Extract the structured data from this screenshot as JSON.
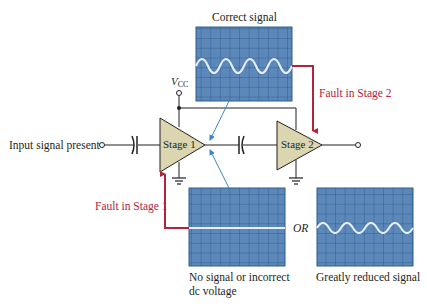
{
  "labels": {
    "correct_signal": "Correct signal",
    "vcc_main": "V",
    "vcc_sub": "CC",
    "input": "Input signal present",
    "stage1": "Stage 1",
    "stage2": "Stage 2",
    "fault_stage2": "Fault in Stage 2",
    "fault_stage1": "Fault in Stage 1",
    "or": "OR",
    "no_signal_line1": "No signal or incorrect",
    "no_signal_line2": "dc voltage",
    "reduced_signal": "Greatly reduced signal"
  },
  "scopes": [
    {
      "id": "correct",
      "caption": "Correct signal",
      "waveform": "sine",
      "cycles": 4,
      "amplitude": "full"
    },
    {
      "id": "no-signal",
      "caption": "No signal or incorrect dc voltage",
      "waveform": "flat"
    },
    {
      "id": "reduced",
      "caption": "Greatly reduced signal",
      "waveform": "sine",
      "cycles": 4,
      "amplitude": "reduced"
    }
  ],
  "colors": {
    "scope_bg": "#5b88b9",
    "scope_grid": "#2f5d8e",
    "trace": "#e8f1fb",
    "amp_fill": "#dcd6b0",
    "fault_red": "#b5223a",
    "probe_blue": "#3a86c8",
    "wire": "#231f20"
  }
}
